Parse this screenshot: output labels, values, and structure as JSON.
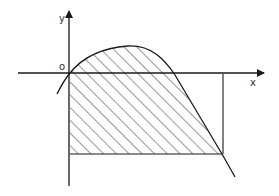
{
  "diagram": {
    "title": "",
    "axes": {
      "x_label": "x",
      "y_label": "y",
      "origin_label": "o"
    },
    "region": {
      "description": "Hatched region bounded by a curve above, the y-axis on the left, a horizontal line below, and the curve on the right",
      "fill_pattern": "diagonal-hatch"
    },
    "colors": {
      "stroke": "#1a1a1a",
      "background": "#ffffff"
    }
  }
}
